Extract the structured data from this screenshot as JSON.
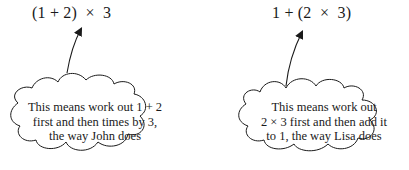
{
  "diagrams": [
    {
      "expression": "(1 + 2)  ×  3",
      "explanation": [
        "This means work out 1 + 2",
        "first and then times by 3,",
        "the way John does"
      ]
    },
    {
      "expression": "1 + (2  ×  3)",
      "explanation": [
        "This means work out",
        "2 × 3 first and then add it",
        "to 1, the way Lisa does"
      ]
    }
  ],
  "colors": {
    "ink": "#1a1a1a",
    "background": "#ffffff"
  }
}
